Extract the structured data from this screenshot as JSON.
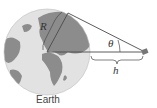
{
  "diagram": {
    "caption": "Earth",
    "labels": {
      "radius": "R",
      "angle": "θ",
      "height": "h"
    },
    "colors": {
      "ocean": "#e3e3e3",
      "land": "#8a8a8a",
      "lines": "#4a4a4a",
      "satellite": "#777777"
    },
    "elements": [
      "earth-globe",
      "radius-segment",
      "tangent-line",
      "center-line",
      "satellite",
      "height-brace"
    ]
  }
}
